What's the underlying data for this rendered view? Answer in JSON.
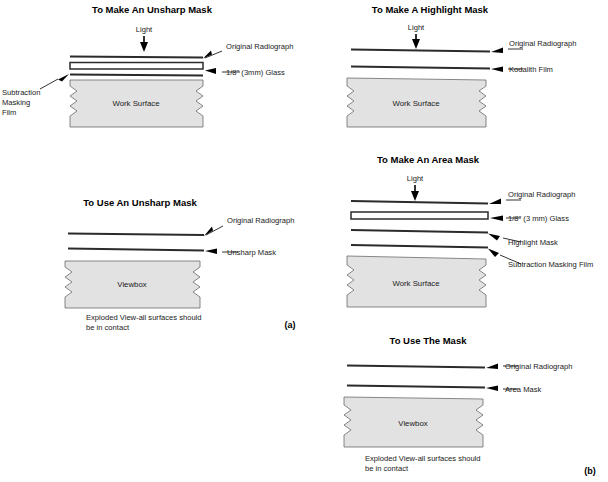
{
  "figure": {
    "part_a_label": "(a)",
    "part_b_label": "(b)",
    "exploded_caption_line1": "Exploded View-all surfaces should",
    "exploded_caption_line2": "be in contact",
    "light_label": "Light"
  },
  "panels": [
    {
      "id": "make-unsharp-mask",
      "title": "To Make An Unsharp Mask",
      "light_label": "Light",
      "layers": [
        {
          "name": "original-radiograph",
          "label": "Original Radiograph",
          "type": "film",
          "side": "right"
        },
        {
          "name": "glass",
          "label": "1/8\" (3mm) Glass",
          "type": "glass",
          "side": "right"
        },
        {
          "name": "subtraction-masking-film",
          "label": "Subtraction Masking Film",
          "type": "film",
          "side": "left"
        },
        {
          "name": "work-surface",
          "label": "Work Surface",
          "type": "surface",
          "side": "inner"
        }
      ],
      "left_label_lines": [
        "Subtraction",
        "Masking",
        "Film"
      ]
    },
    {
      "id": "make-highlight-mask",
      "title": "To Make A Highlight Mask",
      "light_label": "Light",
      "layers": [
        {
          "name": "original-radiograph",
          "label": "Original Radiograph",
          "type": "film",
          "side": "right"
        },
        {
          "name": "kodalith-film",
          "label": "Kodalith Film",
          "type": "film",
          "side": "right"
        },
        {
          "name": "work-surface",
          "label": "Work Surface",
          "type": "surface",
          "side": "inner"
        }
      ]
    },
    {
      "id": "use-unsharp-mask",
      "title": "To Use An Unsharp Mask",
      "layers": [
        {
          "name": "original-radiograph",
          "label": "Original Radiograph",
          "type": "film",
          "side": "right"
        },
        {
          "name": "unsharp-mask",
          "label": "Unsharp Mask",
          "type": "film",
          "side": "right"
        },
        {
          "name": "viewbox",
          "label": "Viewbox",
          "type": "surface",
          "side": "inner"
        }
      ],
      "caption_line1": "Exploded View-all surfaces should",
      "caption_line2": "be in contact"
    },
    {
      "id": "make-area-mask",
      "title": "To Make An Area Mask",
      "light_label": "Light",
      "layers": [
        {
          "name": "original-radiograph",
          "label": "Original Radiograph",
          "type": "film",
          "side": "right"
        },
        {
          "name": "glass",
          "label": "1/8\" (3 mm) Glass",
          "type": "glass",
          "side": "right"
        },
        {
          "name": "highlight-mask",
          "label": "Highlight Mask",
          "type": "film",
          "side": "right"
        },
        {
          "name": "subtraction-masking-film",
          "label": "Subtraction Masking Film",
          "type": "film",
          "side": "right"
        },
        {
          "name": "work-surface",
          "label": "Work Surface",
          "type": "surface",
          "side": "inner"
        }
      ]
    },
    {
      "id": "use-the-mask",
      "title": "To Use The Mask",
      "layers": [
        {
          "name": "original-radiograph",
          "label": "Original Radiograph",
          "type": "film",
          "side": "right"
        },
        {
          "name": "area-mask",
          "label": "Area Mask",
          "type": "film",
          "side": "right"
        },
        {
          "name": "viewbox",
          "label": "Viewbox",
          "type": "surface",
          "side": "inner"
        }
      ],
      "caption_line1": "Exploded View-all surfaces should",
      "caption_line2": "be in contact"
    }
  ],
  "colors": {
    "surface_fill": "#e2e2e2",
    "surface_stroke": "#6b6b6b",
    "film_stroke": "#2b2b2b",
    "leader_stroke": "#000000",
    "background": "#ffffff"
  }
}
